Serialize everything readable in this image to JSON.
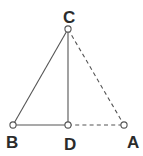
{
  "figure": {
    "background_color": "#ffffff",
    "stroke_color": "#555555",
    "label_color": "#2b2b2b",
    "width": 143,
    "height": 156
  },
  "points": [
    {
      "id": "A",
      "label": "A",
      "x": 124,
      "y": 125,
      "label_x": 127,
      "label_y": 148
    },
    {
      "id": "B",
      "label": "B",
      "x": 13,
      "y": 125,
      "label_x": 6,
      "label_y": 148
    },
    {
      "id": "C",
      "label": "C",
      "x": 68,
      "y": 29,
      "label_x": 63,
      "label_y": 23
    },
    {
      "id": "D",
      "label": "D",
      "x": 68,
      "y": 125,
      "label_x": 64,
      "label_y": 150
    }
  ],
  "edges": [
    {
      "id": "BC",
      "from": "B",
      "to": "C",
      "style": "solid",
      "label": "segment-b-c"
    },
    {
      "id": "CD",
      "from": "C",
      "to": "D",
      "style": "solid",
      "label": "segment-c-d"
    },
    {
      "id": "BD",
      "from": "B",
      "to": "D",
      "style": "solid",
      "label": "segment-b-d"
    },
    {
      "id": "CA",
      "from": "C",
      "to": "A",
      "style": "dashed",
      "label": "segment-c-a"
    },
    {
      "id": "DA",
      "from": "D",
      "to": "A",
      "style": "dashed",
      "label": "segment-d-a"
    }
  ],
  "vertex_marker": {
    "radius": 3.1,
    "fill": "#ffffff",
    "stroke": "#555555"
  }
}
